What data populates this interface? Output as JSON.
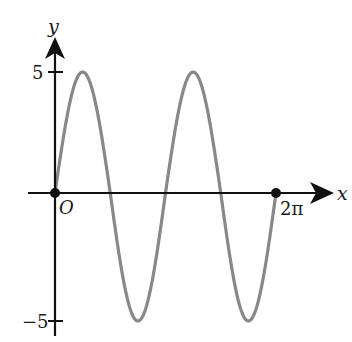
{
  "chart_data": {
    "type": "line",
    "title": "",
    "function": "y = 5 sin(2x)",
    "xlabel": "x",
    "ylabel": "y",
    "origin_label": "O",
    "x_tick_labels": [
      "2π"
    ],
    "y_tick_labels": [
      "5",
      "−5"
    ],
    "xlim": [
      0,
      6.2832
    ],
    "ylim": [
      -5,
      5
    ],
    "amplitude": 5,
    "period": 3.1416,
    "grid": false,
    "series": [
      {
        "name": "curve",
        "color": "#888888",
        "x": [
          0,
          0.7854,
          1.5708,
          2.3562,
          3.1416,
          3.927,
          4.7124,
          5.4978,
          6.2832
        ],
        "y": [
          0,
          5,
          0,
          -5,
          0,
          5,
          0,
          -5,
          0
        ]
      }
    ],
    "marked_points": [
      {
        "label": "O",
        "x": 0,
        "y": 0
      },
      {
        "label": "2π",
        "x": 6.2832,
        "y": 0
      }
    ]
  },
  "colors": {
    "axes": "#111111",
    "curve": "#888888"
  }
}
